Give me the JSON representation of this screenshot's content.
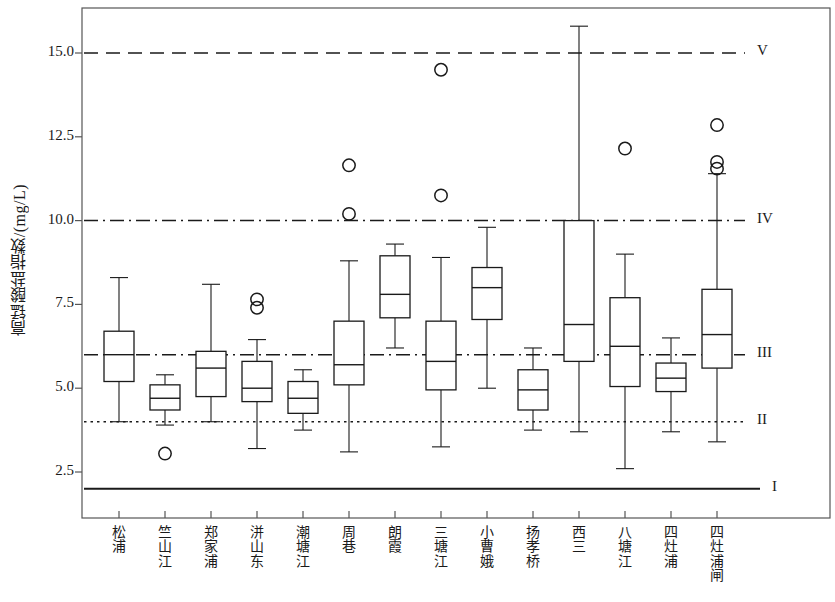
{
  "chart_data": {
    "type": "box",
    "title": "",
    "xlabel": "",
    "ylabel": "高锰酸盐指数/(mg/L)",
    "ylim": [
      1.55,
      16.6
    ],
    "yticks": [
      2.5,
      5.0,
      7.5,
      10.0,
      12.5,
      15.0
    ],
    "ytick_labels": [
      "2.5",
      "5.0",
      "7.5",
      "10.0",
      "12.5",
      "15.0"
    ],
    "grid": false,
    "legend_position": "right-inline",
    "categories": [
      "松浦",
      "竺山江",
      "郑家浦",
      "洴山东",
      "潮塘江",
      "周巷",
      "朗霞",
      "三塘江",
      "小曹娥",
      "扬孝桥",
      "西三",
      "八塘江",
      "四灶浦",
      "四灶浦闸"
    ],
    "boxes": [
      {
        "category": "松浦",
        "whisker_low": 4.0,
        "q1": 5.2,
        "median": 6.0,
        "q3": 6.7,
        "whisker_high": 8.3,
        "outliers": []
      },
      {
        "category": "竺山江",
        "whisker_low": 3.9,
        "q1": 4.35,
        "median": 4.7,
        "q3": 5.1,
        "whisker_high": 5.4,
        "outliers": [
          3.05
        ]
      },
      {
        "category": "郑家浦",
        "whisker_low": 4.0,
        "q1": 4.75,
        "median": 5.6,
        "q3": 6.1,
        "whisker_high": 8.1,
        "outliers": []
      },
      {
        "category": "洴山东",
        "whisker_low": 3.2,
        "q1": 4.6,
        "median": 5.0,
        "q3": 5.8,
        "whisker_high": 6.45,
        "outliers": [
          7.65,
          7.4
        ]
      },
      {
        "category": "潮塘江",
        "whisker_low": 3.75,
        "q1": 4.25,
        "median": 4.7,
        "q3": 5.2,
        "whisker_high": 5.55,
        "outliers": []
      },
      {
        "category": "周巷",
        "whisker_low": 3.1,
        "q1": 5.1,
        "median": 5.7,
        "q3": 7.0,
        "whisker_high": 8.8,
        "outliers": [
          11.65,
          10.2
        ]
      },
      {
        "category": "朗霞",
        "whisker_low": 6.2,
        "q1": 7.1,
        "median": 7.8,
        "q3": 8.95,
        "whisker_high": 9.3,
        "outliers": []
      },
      {
        "category": "三塘江",
        "whisker_low": 3.25,
        "q1": 4.95,
        "median": 5.8,
        "q3": 7.0,
        "whisker_high": 8.9,
        "outliers": [
          14.5,
          10.75
        ]
      },
      {
        "category": "小曹娥",
        "whisker_low": 5.0,
        "q1": 7.05,
        "median": 8.0,
        "q3": 8.6,
        "whisker_high": 9.8,
        "outliers": []
      },
      {
        "category": "扬孝桥",
        "whisker_low": 3.75,
        "q1": 4.35,
        "median": 4.95,
        "q3": 5.55,
        "whisker_high": 6.2,
        "outliers": []
      },
      {
        "category": "西三",
        "whisker_low": 3.7,
        "q1": 5.8,
        "median": 6.9,
        "q3": 10.0,
        "whisker_high": 15.8,
        "outliers": []
      },
      {
        "category": "八塘江",
        "whisker_low": 2.6,
        "q1": 5.05,
        "median": 6.25,
        "q3": 7.7,
        "whisker_high": 9.0,
        "outliers": [
          12.15
        ]
      },
      {
        "category": "四灶浦",
        "whisker_low": 3.7,
        "q1": 4.9,
        "median": 5.3,
        "q3": 5.75,
        "whisker_high": 6.5,
        "outliers": []
      },
      {
        "category": "四灶浦闸",
        "whisker_low": 3.4,
        "q1": 5.6,
        "median": 6.6,
        "q3": 7.95,
        "whisker_high": 11.4,
        "outliers": [
          12.85,
          11.75,
          11.55
        ]
      }
    ],
    "threshold_lines": [
      {
        "label": "V",
        "value": 15.0,
        "style": "dashed"
      },
      {
        "label": "IV",
        "value": 10.0,
        "style": "dashdot"
      },
      {
        "label": "III",
        "value": 6.0,
        "style": "dashdot"
      },
      {
        "label": "II",
        "value": 4.0,
        "style": "dotted"
      },
      {
        "label": "I",
        "value": 2.0,
        "style": "solid"
      }
    ]
  },
  "style": {
    "line_color": "#1a1a1a",
    "box_fill": "#ffffff",
    "frame_color": "#555555",
    "background": "#ffffff"
  }
}
